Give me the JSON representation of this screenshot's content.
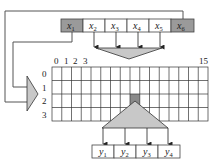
{
  "diagram": {
    "input_register": {
      "cells": [
        {
          "var": "x",
          "sub": "1",
          "shaded": true
        },
        {
          "var": "x",
          "sub": "2",
          "shaded": false
        },
        {
          "var": "x",
          "sub": "3",
          "shaded": false
        },
        {
          "var": "x",
          "sub": "4",
          "shaded": false
        },
        {
          "var": "x",
          "sub": "5",
          "shaded": false
        },
        {
          "var": "x",
          "sub": "6",
          "shaded": true
        }
      ]
    },
    "table": {
      "column_labels": [
        "0",
        "1",
        "2",
        "3",
        "15"
      ],
      "row_labels": [
        "0",
        "1",
        "2",
        "3"
      ],
      "columns": 16,
      "rows": 4,
      "highlighted_cell": {
        "row": 2,
        "col": 8
      }
    },
    "output_register": {
      "cells": [
        {
          "var": "y",
          "sub": "1"
        },
        {
          "var": "y",
          "sub": "2"
        },
        {
          "var": "y",
          "sub": "3"
        },
        {
          "var": "y",
          "sub": "4"
        }
      ]
    },
    "colors": {
      "shaded_cell": "#9a9a9a",
      "funnel_fill": "#c8c8c8",
      "highlight_cell": "#8a8a8a",
      "line": "#333333"
    }
  }
}
